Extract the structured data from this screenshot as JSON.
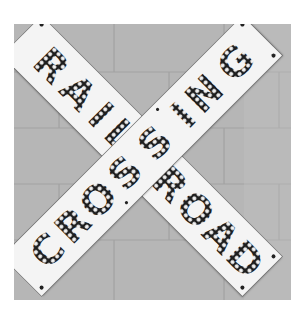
{
  "image": {
    "description": "Black and white photograph of a railroad crossbuck sign mounted on a cinder block wall",
    "colors": {
      "frame_background": "#ffffff",
      "wall": "#b4b4b4",
      "mortar": "#a4a4a4",
      "board": "#f4f4f4",
      "letter_dark": "#1e1e1e",
      "bulb": "#f4f4f4",
      "bolt": "#222222"
    }
  },
  "sign": {
    "type": "crossbuck",
    "boards": [
      {
        "id": "railroad",
        "text": "RAILROAD",
        "orientation": "top-left to bottom-right"
      },
      {
        "id": "crossing",
        "text": "CROSSING",
        "orientation": "bottom-left to top-right"
      }
    ]
  }
}
